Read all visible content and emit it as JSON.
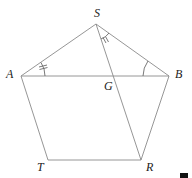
{
  "diagram": {
    "type": "geometry",
    "points": {
      "S": {
        "x": 96,
        "y": 24,
        "label": "S",
        "lx": 94,
        "ly": 17
      },
      "A": {
        "x": 21,
        "y": 76,
        "label": "A",
        "lx": 6,
        "ly": 78
      },
      "B": {
        "x": 169,
        "y": 76,
        "label": "B",
        "lx": 175,
        "ly": 78
      },
      "G": {
        "x": 112,
        "y": 76,
        "label": "G",
        "lx": 104,
        "ly": 90
      },
      "T": {
        "x": 48,
        "y": 160,
        "label": "T",
        "lx": 37,
        "ly": 171
      },
      "R": {
        "x": 141,
        "y": 160,
        "label": "R",
        "lx": 146,
        "ly": 171
      }
    },
    "segments": [
      [
        "S",
        "A"
      ],
      [
        "S",
        "B"
      ],
      [
        "A",
        "B"
      ],
      [
        "A",
        "T"
      ],
      [
        "T",
        "R"
      ],
      [
        "R",
        "B"
      ],
      [
        "S",
        "R"
      ]
    ],
    "angle_marks": [
      {
        "vertex": "A",
        "type": "arc-double-tick",
        "between": [
          "S",
          "B"
        ]
      },
      {
        "vertex": "S",
        "type": "arc-double-tick",
        "between": [
          "R",
          "B"
        ]
      },
      {
        "vertex": "B",
        "type": "arc",
        "between": [
          "A",
          "S"
        ]
      }
    ],
    "labels": {
      "S": "S",
      "A": "A",
      "B": "B",
      "G": "G",
      "T": "T",
      "R": "R"
    }
  }
}
